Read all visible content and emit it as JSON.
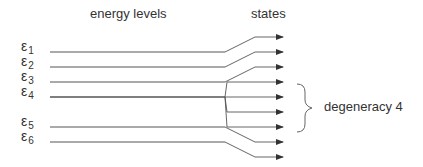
{
  "diagram": {
    "headers": {
      "levels": "energy levels",
      "states": "states"
    },
    "levels": [
      {
        "symbol": "ε",
        "index": "1",
        "y": 52,
        "fan_to": [
          37
        ]
      },
      {
        "symbol": "ε",
        "index": "2",
        "y": 67,
        "fan_to": [
          52
        ]
      },
      {
        "symbol": "ε",
        "index": "3",
        "y": 82,
        "fan_to": [
          67
        ]
      },
      {
        "symbol": "ε",
        "index": "4",
        "y": 97,
        "fan_to": [
          82,
          97,
          112,
          127
        ]
      },
      {
        "symbol": "ε",
        "index": "5",
        "y": 127,
        "fan_to": [
          142
        ]
      },
      {
        "symbol": "ε",
        "index": "6",
        "y": 142,
        "fan_to": [
          157
        ]
      }
    ],
    "degeneracy_label": "degeneracy 4",
    "colors": {
      "line": "#555555",
      "text": "#333333"
    }
  }
}
